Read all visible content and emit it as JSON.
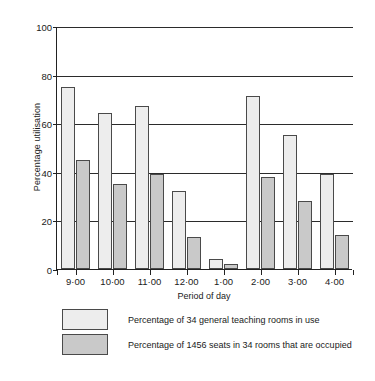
{
  "chart_data": {
    "type": "bar",
    "title": "",
    "xlabel": "Period of day",
    "ylabel": "Percentage utilisation",
    "categories": [
      "9·00",
      "10·00",
      "11·00",
      "12·00",
      "1·00",
      "2·00",
      "3·00",
      "4·00"
    ],
    "series": [
      {
        "name": "Percentage of 34 general teaching rooms in use",
        "color": "#ededed",
        "values": [
          75,
          64,
          67,
          32,
          4,
          71,
          55,
          39
        ]
      },
      {
        "name": "Percentage of 1456 seats in 34 rooms that are occupied",
        "color": "#c9c9c9",
        "values": [
          45,
          35,
          39,
          13,
          2,
          38,
          28,
          14
        ]
      }
    ],
    "ylim": [
      0,
      100
    ],
    "yticks": [
      0,
      20,
      40,
      60,
      80,
      100
    ],
    "ytick_labels": [
      "0",
      "20",
      "40",
      "60",
      "80",
      "100"
    ],
    "grid": true,
    "grid_axis": "y",
    "legend_position": "below"
  },
  "legend": {
    "items": [
      {
        "label": "Percentage of 34 general teaching rooms in use",
        "swatch": "light"
      },
      {
        "label": "Percentage of 1456 seats in 34 rooms that are occupied",
        "swatch": "dark"
      }
    ]
  }
}
